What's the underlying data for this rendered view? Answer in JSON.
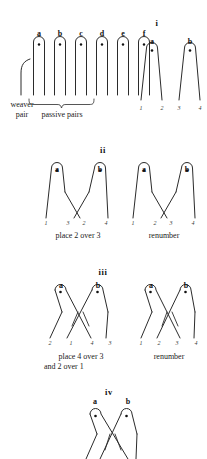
{
  "figure": {
    "title_implicit": "",
    "stroke_color": "#2b2b2b",
    "text_color": "#1a1a1a"
  },
  "panel_setup": {
    "pin_labels": [
      "a",
      "b",
      "c",
      "d",
      "e",
      "f"
    ],
    "weaver_label_line1": "weaver",
    "weaver_label_line2": "pair",
    "passive_label": "passive pairs"
  },
  "panel_i": {
    "roman": "i",
    "pair_labels": [
      "a",
      "b"
    ],
    "thread_numbers": [
      "1",
      "2",
      "3",
      "4"
    ]
  },
  "panel_ii": {
    "roman": "ii",
    "left": {
      "pair_labels": [
        "a",
        "b"
      ],
      "thread_numbers": [
        "1",
        "3",
        "2",
        "4"
      ],
      "caption": "place 2 over 3"
    },
    "right": {
      "pair_labels": [
        "a",
        "b"
      ],
      "thread_numbers": [
        "1",
        "2",
        "3",
        "4"
      ],
      "caption": "renumber"
    }
  },
  "panel_iii": {
    "roman": "iii",
    "left": {
      "pair_labels": [
        "a",
        "b"
      ],
      "thread_numbers": [
        "2",
        "1",
        "4",
        "3"
      ],
      "caption_line1": "place 4 over 3",
      "caption_line2": "and 2 over 1"
    },
    "right": {
      "pair_labels": [
        "a",
        "b"
      ],
      "thread_numbers": [
        "1",
        "2",
        "3",
        "4"
      ],
      "caption": "renumber"
    }
  },
  "panel_iv": {
    "roman": "iv",
    "pair_labels": [
      "a",
      "b"
    ]
  }
}
